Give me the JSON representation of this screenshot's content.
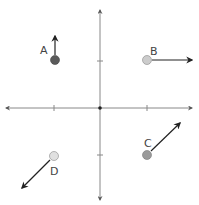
{
  "diagram": {
    "type": "coordinate-plane-vectors",
    "axes": {
      "origin": [
        100,
        108
      ],
      "x_range_px": [
        6,
        192
      ],
      "y_range_px": [
        10,
        200
      ],
      "ticks_x": [
        54,
        147
      ],
      "ticks_y": [
        61,
        155
      ],
      "color": "#777777"
    },
    "points": [
      {
        "id": "A",
        "label": "A",
        "quadrant": "II",
        "x": 55,
        "y": 60,
        "fill": "#5a5a5a",
        "arrow_to": [
          55,
          36
        ],
        "direction": "up",
        "label_pos": [
          41,
          53
        ]
      },
      {
        "id": "B",
        "label": "B",
        "quadrant": "I",
        "x": 147,
        "y": 60,
        "fill": "#cccccc",
        "arrow_to": [
          192,
          60
        ],
        "direction": "right",
        "label_pos": [
          150,
          54
        ]
      },
      {
        "id": "C",
        "label": "C",
        "quadrant": "IV",
        "x": 147,
        "y": 155,
        "fill": "#9a9a9a",
        "arrow_to": [
          180,
          123
        ],
        "direction": "up-right",
        "label_pos": [
          145,
          146
        ]
      },
      {
        "id": "D",
        "label": "D",
        "quadrant": "III",
        "x": 54,
        "y": 156,
        "fill": "#dddddd",
        "arrow_to": [
          22,
          188
        ],
        "direction": "down-left",
        "label_pos": [
          50,
          174
        ]
      }
    ]
  }
}
